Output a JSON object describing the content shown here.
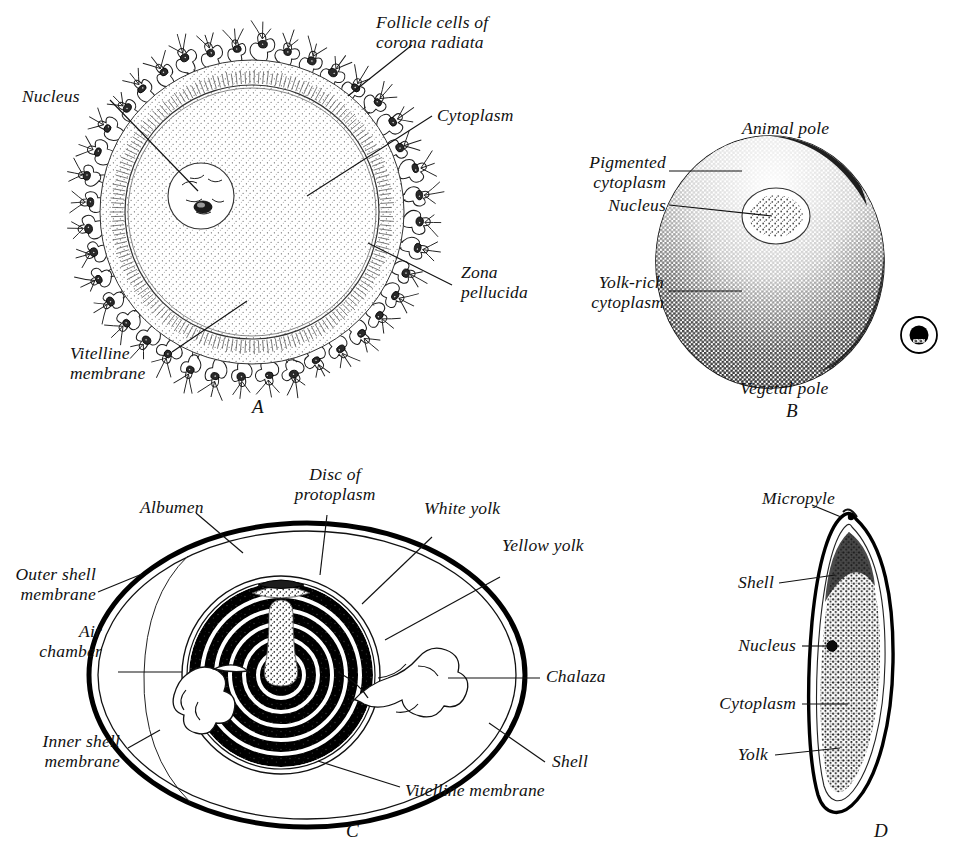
{
  "figure": {
    "background_color": "#ffffff",
    "ink_color": "#111111"
  },
  "panels": [
    {
      "letter": "A",
      "name": "mammalian-ovum",
      "labels": [
        {
          "id": "follicle-cells",
          "text": "Follicle cells of\ncorona radiata"
        },
        {
          "id": "nucleus",
          "text": "Nucleus"
        },
        {
          "id": "cytoplasm",
          "text": "Cytoplasm"
        },
        {
          "id": "zona-pellucida",
          "text": "Zona\npellucida"
        },
        {
          "id": "vitelline-membrane",
          "text": "Vitelline\nmembrane"
        }
      ]
    },
    {
      "letter": "B",
      "name": "amphibian-egg",
      "labels": [
        {
          "id": "animal-pole",
          "text": "Animal pole"
        },
        {
          "id": "pigmented-cytoplasm",
          "text": "Pigmented\ncytoplasm"
        },
        {
          "id": "nucleus",
          "text": "Nucleus"
        },
        {
          "id": "yolk-rich-cytoplasm",
          "text": "Yolk-rich\ncytoplasm"
        },
        {
          "id": "vegetal-pole",
          "text": "Vegetal pole"
        }
      ]
    },
    {
      "letter": "C",
      "name": "hens-egg",
      "labels": [
        {
          "id": "albumen",
          "text": "Albumen"
        },
        {
          "id": "disc-of-protoplasm",
          "text": "Disc of\nprotoplasm"
        },
        {
          "id": "white-yolk",
          "text": "White yolk"
        },
        {
          "id": "yellow-yolk",
          "text": "Yellow yolk"
        },
        {
          "id": "outer-shell-membrane",
          "text": "Outer shell\nmembrane"
        },
        {
          "id": "air-chamber",
          "text": "Air\nchamber"
        },
        {
          "id": "inner-shell-membrane",
          "text": "Inner shell\nmembrane"
        },
        {
          "id": "chalaza",
          "text": "Chalaza"
        },
        {
          "id": "shell",
          "text": "Shell"
        },
        {
          "id": "vitelline-membrane",
          "text": "Vitelline membrane"
        }
      ]
    },
    {
      "letter": "D",
      "name": "insect-egg",
      "labels": [
        {
          "id": "micropyle",
          "text": "Micropyle"
        },
        {
          "id": "shell",
          "text": "Shell"
        },
        {
          "id": "nucleus",
          "text": "Nucleus"
        },
        {
          "id": "cytoplasm",
          "text": "Cytoplasm"
        },
        {
          "id": "yolk",
          "text": "Yolk"
        }
      ]
    }
  ],
  "panel_a": {
    "letter": "A",
    "follicle_cells": "Follicle cells of",
    "corona_radiata": "corona radiata",
    "nucleus": "Nucleus",
    "cytoplasm": "Cytoplasm",
    "zona": "Zona",
    "pellucida": "pellucida",
    "vitelline": "Vitelline",
    "membrane": "membrane"
  },
  "panel_b": {
    "letter": "B",
    "animal_pole": "Animal pole",
    "pigmented": "Pigmented",
    "cytoplasm_2": "cytoplasm",
    "nucleus": "Nucleus",
    "yolk_rich": "Yolk-rich",
    "cytoplasm_3": "cytoplasm",
    "vegetal_pole": "Vegetal pole",
    "scale_inset": "scale-egg-inset"
  },
  "panel_c": {
    "letter": "C",
    "albumen": "Albumen",
    "disc_of": "Disc of",
    "protoplasm": "protoplasm",
    "white_yolk": "White yolk",
    "yellow_yolk": "Yellow yolk",
    "outer_shell": "Outer shell",
    "membrane_1": "membrane",
    "air": "Air",
    "chamber": "chamber",
    "inner_shell": "Inner shell",
    "membrane_2": "membrane",
    "chalaza": "Chalaza",
    "shell": "Shell",
    "vitelline_membrane": "Vitelline membrane"
  },
  "panel_d": {
    "letter": "D",
    "micropyle": "Micropyle",
    "shell": "Shell",
    "nucleus": "Nucleus",
    "cytoplasm": "Cytoplasm",
    "yolk": "Yolk"
  }
}
